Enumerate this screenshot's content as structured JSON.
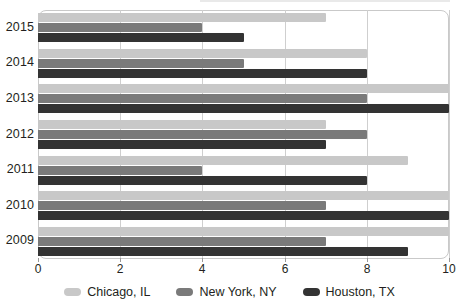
{
  "chart_data": {
    "type": "bar",
    "orientation": "horizontal",
    "title": "",
    "subtitle": "",
    "xlabel": "",
    "ylabel": "",
    "categories": [
      "2015",
      "2014",
      "2013",
      "2012",
      "2011",
      "2010",
      "2009"
    ],
    "series": [
      {
        "name": "Chicago, IL",
        "color": "#c8c8c8",
        "values": [
          7,
          8,
          10,
          7,
          9,
          10,
          10
        ]
      },
      {
        "name": "New York, NY",
        "color": "#7a7a7a",
        "values": [
          4,
          5,
          8,
          8,
          4,
          7,
          7
        ]
      },
      {
        "name": "Houston, TX",
        "color": "#333333",
        "values": [
          5,
          8,
          10,
          7,
          8,
          10,
          9
        ]
      }
    ],
    "xlim": [
      0,
      10
    ],
    "xticks": [
      0,
      2,
      4,
      6,
      8,
      10
    ],
    "xtick_labels": [
      "0",
      "2",
      "4",
      "6",
      "8",
      "10"
    ],
    "grid": true,
    "grid_axis": "x",
    "legend_position": "bottom",
    "legend_entries": [
      "Chicago, IL",
      "New York, NY",
      "Houston, TX"
    ]
  },
  "legend": {
    "items": [
      {
        "label": "Chicago, IL"
      },
      {
        "label": "New York, NY"
      },
      {
        "label": "Houston, TX"
      }
    ]
  }
}
